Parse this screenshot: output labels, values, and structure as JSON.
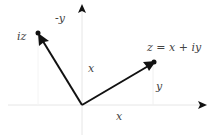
{
  "diagram": {
    "colors": {
      "axis": "#e6e6e6",
      "vector": "#111111",
      "label": "#444444",
      "background": "#ffffff"
    },
    "labels": {
      "z_vector": "z = x + iy",
      "iz_vector": "iz",
      "neg_y": "-y",
      "x_vertical": "x",
      "y_right": "y",
      "x_bottom": "x"
    },
    "vectors": [
      {
        "name": "z",
        "from": [
          0,
          0
        ],
        "to": [
          "x",
          "y"
        ]
      },
      {
        "name": "iz",
        "from": [
          0,
          0
        ],
        "to": [
          "-y",
          "x"
        ]
      }
    ],
    "axes": [
      "real-axis",
      "imaginary-axis"
    ]
  }
}
